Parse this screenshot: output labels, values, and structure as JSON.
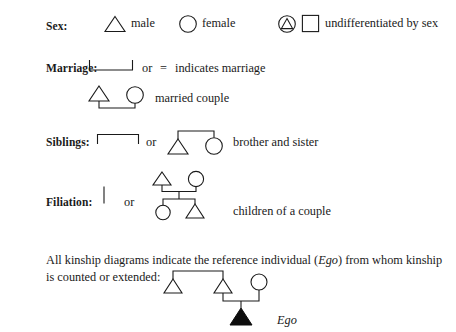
{
  "document": {
    "type": "kinship-diagram-legend",
    "background_color": "#ffffff",
    "ink_color": "#1a1a1a"
  },
  "rows": {
    "sex": {
      "label": "Sex:",
      "male_label": "male",
      "female_label": "female",
      "undifferentiated_label": "undifferentiated by sex",
      "symbols": {
        "male": "triangle-outline",
        "female": "circle-outline",
        "undifferentiated_a": "circle-with-inscribed-triangle",
        "undifferentiated_b": "square-outline"
      }
    },
    "marriage": {
      "label": "Marriage:",
      "or_label": "or",
      "equals_label": "=",
      "indicates_label": "indicates marriage",
      "married_couple_label": "married couple",
      "symbols": {
        "bracket": "marriage-bracket-u-shape",
        "couple": "triangle-circle-joined-by-marriage-bracket"
      }
    },
    "siblings": {
      "label": "Siblings:",
      "or_label": "or",
      "brother_sister_label": "brother and sister",
      "symbols": {
        "bracket": "sibling-bracket-inverted-u-shape",
        "pair": "triangle-circle-joined-by-sibling-bracket"
      }
    },
    "filiation": {
      "label": "Filiation:",
      "or_label": "or",
      "children_label": "children of a couple",
      "symbols": {
        "descent_line": "vertical-filiation-line",
        "family": "parents-marriage-bracket-descent-line-two-children"
      }
    }
  },
  "ego_note": {
    "line1_before_italic": "All kinship diagrams indicate the reference individual (",
    "line1_italic": "Ego",
    "line1_after_italic": ") from whom kinship",
    "line2": "is counted or extended:",
    "ego_label": "Ego",
    "symbols": {
      "diagram": "two-brothers-one-married-with-filled-triangle-child",
      "ego_marker": "filled-black-triangle"
    }
  }
}
